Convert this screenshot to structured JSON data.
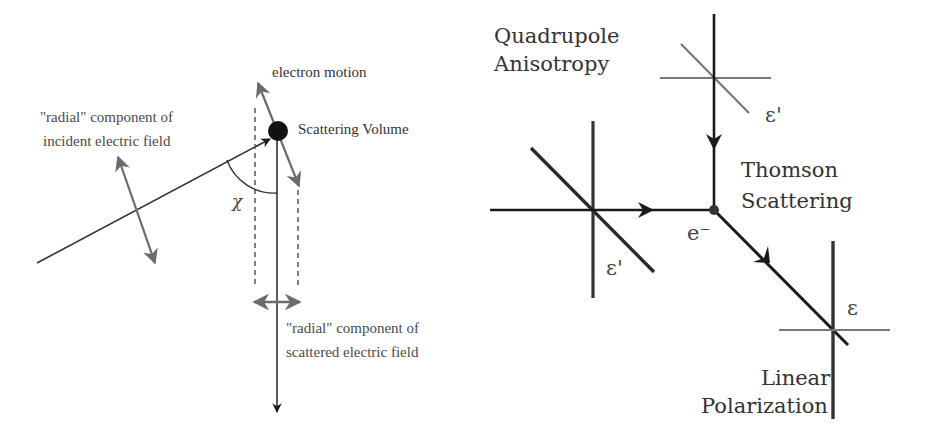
{
  "left_diagram": {
    "title": "Scattering geometry",
    "labels": {
      "electron_motion": "electron motion",
      "scattering_volume": "Scattering Volume",
      "incident_line1": "\"radial\" component of",
      "incident_line2": "incident electric field",
      "scattered_line1": "\"radial\" component of",
      "scattered_line2": "scattered electric field",
      "angle": "χ"
    }
  },
  "right_diagram": {
    "title": "Thomson scattering polarization",
    "labels": {
      "quadrupole_line1": "Quadrupole",
      "quadrupole_line2": "Anisotropy",
      "thomson_line1": "Thomson",
      "thomson_line2": "Scattering",
      "electron": "e⁻",
      "epsilon_prime_top": "ε'",
      "epsilon_prime_left": "ε'",
      "epsilon_out": "ε",
      "linear_line1": "Linear",
      "linear_line2": "Polarization"
    }
  },
  "colors": {
    "dark_line": "#1a1a1a",
    "gray_line": "#6b6b6b",
    "text": "#444444"
  }
}
